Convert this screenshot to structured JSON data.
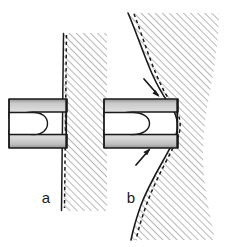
{
  "figure": {
    "panels": [
      {
        "id": "a",
        "label": "a",
        "label_x": 46,
        "label_y": 203,
        "description": "Undeformed straight hatched wall gripped by a slotted fork clamp",
        "wall_state": "straight",
        "arrows": []
      },
      {
        "id": "b",
        "label": "b",
        "label_x": 131,
        "label_y": 203,
        "description": "Deformed S-curved hatched wall drawn into the slotted fork clamp with two flow arrows",
        "wall_state": "curved",
        "arrows": [
          {
            "name": "upper-flow-arrow",
            "direction": "down-right"
          },
          {
            "name": "lower-flow-arrow",
            "direction": "up-right"
          }
        ]
      }
    ],
    "colors": {
      "outline": "#1a1a1a",
      "hatch_line": "#8a8a8a",
      "fork_fill_light": "#d8d8d8",
      "fork_fill_mid": "#b5b5b5",
      "fork_fill_dark": "#9a9a9a",
      "background": "#ffffff",
      "dashed_line": "#1a1a1a"
    },
    "elements": {
      "fork_a_name": "fork-clamp-a",
      "fork_b_name": "fork-clamp-b",
      "wall_a_name": "hatched-wall-a",
      "wall_b_name": "hatched-wall-b",
      "dashed_a_name": "dashed-contour-a",
      "dashed_b_name": "dashed-contour-b"
    }
  }
}
